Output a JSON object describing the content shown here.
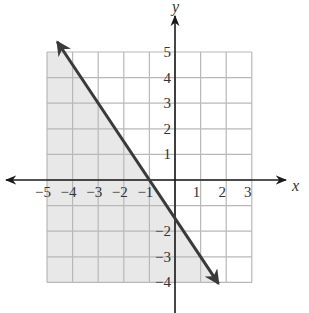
{
  "chart_data": {
    "type": "line",
    "title": "",
    "subtitle": "",
    "xlabel": "x",
    "ylabel": "y",
    "xlim": [
      -5,
      3
    ],
    "ylim": [
      -4,
      5
    ],
    "grid": true,
    "legend": null,
    "x_ticks": [
      -5,
      -4,
      -3,
      -2,
      -1,
      1,
      2,
      3
    ],
    "x_tick_labels": [
      "−5",
      "−4",
      "−3",
      "−2",
      "−1",
      "1",
      "2",
      "3"
    ],
    "y_ticks": [
      5,
      4,
      3,
      2,
      1,
      -2,
      -3,
      -4
    ],
    "y_tick_labels": [
      "5",
      "4",
      "3",
      "2",
      "1",
      "−2",
      "−3",
      "−4"
    ],
    "series": [
      {
        "name": "boundary line",
        "equation": "y = -1.5x - 1.5",
        "style": "solid",
        "arrows": "both",
        "x": [
          -4.6,
          1.7
        ],
        "y": [
          5.4,
          -4.05
        ]
      }
    ],
    "shaded_region": {
      "inequality": "3x + 2y <= -3",
      "side": "below-left",
      "polygon": [
        [
          -5,
          5
        ],
        [
          -4.33,
          5
        ],
        [
          1.67,
          -4
        ],
        [
          -5,
          -4
        ]
      ],
      "color": "#e6e6e6"
    },
    "colors": {
      "grid": "#b8b8b8",
      "axes": "#1a1a1a",
      "line": "#3a3a3a",
      "shade": "#e8e8e8"
    }
  },
  "labels": {
    "x_axis": "x",
    "y_axis": "y"
  }
}
